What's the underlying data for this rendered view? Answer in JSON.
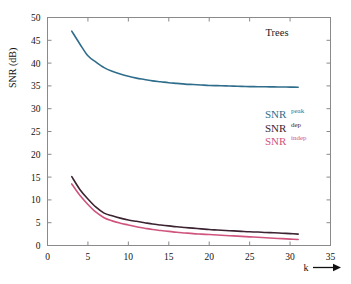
{
  "chart_data": {
    "type": "line",
    "title": "Trees",
    "xlabel": "k",
    "ylabel": "SNR (dB)",
    "xlim": [
      0,
      35
    ],
    "ylim": [
      0,
      50
    ],
    "xticks": [
      0,
      5,
      10,
      15,
      20,
      25,
      30,
      35
    ],
    "yticks": [
      0,
      5,
      10,
      15,
      20,
      25,
      30,
      35,
      40,
      45,
      50
    ],
    "grid": false,
    "legend_position": "inside-right",
    "x": [
      3,
      4,
      5,
      6,
      7,
      8,
      9,
      10,
      11,
      12,
      13,
      14,
      15,
      16,
      17,
      18,
      19,
      20,
      21,
      22,
      23,
      24,
      25,
      26,
      27,
      28,
      29,
      30,
      31
    ],
    "series": [
      {
        "name": "SNR_peak",
        "label_base": "SNR",
        "label_sup": "peak",
        "color": "#2f6d8c",
        "values": [
          47.0,
          44.2,
          41.6,
          40.2,
          39.0,
          38.2,
          37.6,
          37.1,
          36.7,
          36.4,
          36.1,
          35.9,
          35.7,
          35.55,
          35.4,
          35.3,
          35.2,
          35.1,
          35.05,
          35.0,
          34.95,
          34.9,
          34.85,
          34.82,
          34.8,
          34.78,
          34.76,
          34.74,
          34.72
        ]
      },
      {
        "name": "SNR_dep",
        "label_base": "SNR",
        "label_sup": "dep",
        "color": "#3c2331",
        "values": [
          15.1,
          12.3,
          10.2,
          8.4,
          7.1,
          6.5,
          6.0,
          5.6,
          5.3,
          5.0,
          4.7,
          4.5,
          4.3,
          4.1,
          3.95,
          3.8,
          3.65,
          3.5,
          3.4,
          3.3,
          3.2,
          3.1,
          3.0,
          2.95,
          2.85,
          2.8,
          2.7,
          2.6,
          2.5
        ]
      },
      {
        "name": "SNR_indep",
        "label_base": "SNR",
        "label_sup": "indep",
        "color": "#d0547e",
        "values": [
          13.5,
          11.0,
          9.0,
          7.3,
          6.1,
          5.4,
          4.9,
          4.5,
          4.1,
          3.8,
          3.5,
          3.3,
          3.1,
          2.9,
          2.75,
          2.6,
          2.5,
          2.4,
          2.3,
          2.2,
          2.1,
          2.0,
          1.9,
          1.8,
          1.7,
          1.6,
          1.5,
          1.4,
          1.3
        ]
      }
    ]
  },
  "legend": {
    "entries": [
      {
        "base": "SNR",
        "sup": "peak",
        "color": "#2f6d8c"
      },
      {
        "base": "SNR",
        "sup": "dep",
        "color": "#3c2331"
      },
      {
        "base": "SNR",
        "sup": "indep",
        "color": "#d0547e"
      }
    ]
  },
  "axis": {
    "x_arrow_label": "k",
    "y_label": "SNR (dB)"
  }
}
